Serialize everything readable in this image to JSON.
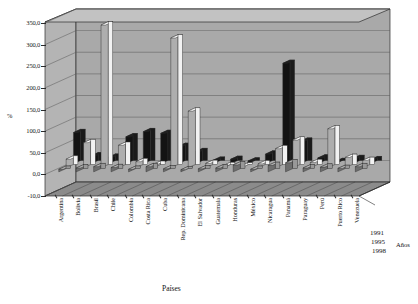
{
  "chart_data": {
    "type": "bar",
    "title": "",
    "xlabel": "Países",
    "ylabel": "%",
    "zlabel": "Años",
    "ylim": [
      -50,
      350
    ],
    "yticks": [
      "350,0",
      "300,0",
      "250,0",
      "200,0",
      "150,0",
      "100,0",
      "50,0",
      "0,0",
      "-10,0"
    ],
    "ytick_values": [
      350,
      300,
      250,
      200,
      150,
      100,
      50,
      0,
      -50
    ],
    "grid": true,
    "legend_position": "depth-axis",
    "projection": "3d",
    "categories": [
      "Argentina",
      "Bolivia",
      "Brasil",
      "Chile",
      "Colombia",
      "Costa Rica",
      "Cuba",
      "Rep. Dominicana",
      "El Salvador",
      "Guatemala",
      "Honduras",
      "México",
      "Nicaragua",
      "Panamá",
      "Paraguay",
      "Perú",
      "Puerto Rico",
      "Venezuela"
    ],
    "series": [
      {
        "name": "1991",
        "color": "#1a1a1a",
        "values": [
          72,
          18,
          15,
          62,
          74,
          70,
          40,
          28,
          8,
          10,
          6,
          22,
          232,
          52,
          13,
          5,
          12,
          9
        ]
      },
      {
        "name": "1995",
        "color": "#f2f2f2",
        "values": [
          20,
          58,
          330,
          52,
          14,
          8,
          300,
          131,
          10,
          5,
          4,
          9,
          44,
          64,
          12,
          90,
          24,
          17
        ]
      },
      {
        "name": "1998",
        "color": "#999999",
        "values": [
          6,
          9,
          12,
          10,
          6,
          12,
          7,
          5,
          7,
          9,
          16,
          6,
          15,
          21,
          9,
          11,
          8,
          12
        ]
      }
    ]
  },
  "colors": {
    "wall": "#a9a9a9",
    "wall_top": "#bdbdbd",
    "floor": "#8b8b8b",
    "grid": "#5a5a5a",
    "outline": "#2b2b2b",
    "series_1991": "#1a1a1a",
    "series_1995": "#f2f2f2",
    "series_1998": "#999999"
  }
}
